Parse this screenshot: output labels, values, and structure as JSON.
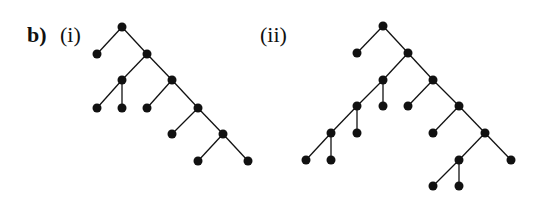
{
  "labels": {
    "panel": "b)",
    "tree1": "(i)",
    "tree2": "(ii)"
  },
  "trees": [
    {
      "name": "(i)",
      "nodes": [
        [
          122,
          27
        ],
        [
          97,
          54
        ],
        [
          147,
          54
        ],
        [
          122,
          80
        ],
        [
          172,
          80
        ],
        [
          97,
          108
        ],
        [
          122,
          108
        ],
        [
          147,
          108
        ],
        [
          198,
          108
        ],
        [
          172,
          134
        ],
        [
          223,
          134
        ],
        [
          198,
          161
        ],
        [
          248,
          161
        ]
      ],
      "edges": [
        [
          0,
          1
        ],
        [
          0,
          2
        ],
        [
          2,
          3
        ],
        [
          2,
          4
        ],
        [
          3,
          5
        ],
        [
          3,
          6
        ],
        [
          4,
          7
        ],
        [
          4,
          8
        ],
        [
          8,
          9
        ],
        [
          8,
          10
        ],
        [
          10,
          11
        ],
        [
          10,
          12
        ]
      ]
    },
    {
      "name": "(ii)",
      "nodes": [
        [
          383,
          26
        ],
        [
          357,
          53
        ],
        [
          408,
          53
        ],
        [
          383,
          80
        ],
        [
          433,
          80
        ],
        [
          357,
          106
        ],
        [
          383,
          106
        ],
        [
          331,
          133
        ],
        [
          357,
          133
        ],
        [
          306,
          160
        ],
        [
          331,
          160
        ],
        [
          408,
          106
        ],
        [
          459,
          106
        ],
        [
          433,
          133
        ],
        [
          485,
          133
        ],
        [
          459,
          160
        ],
        [
          511,
          160
        ],
        [
          433,
          186
        ],
        [
          459,
          186
        ]
      ],
      "edges": [
        [
          0,
          1
        ],
        [
          0,
          2
        ],
        [
          2,
          3
        ],
        [
          2,
          4
        ],
        [
          3,
          5
        ],
        [
          3,
          6
        ],
        [
          5,
          7
        ],
        [
          5,
          8
        ],
        [
          7,
          9
        ],
        [
          7,
          10
        ],
        [
          4,
          11
        ],
        [
          4,
          12
        ],
        [
          12,
          13
        ],
        [
          12,
          14
        ],
        [
          14,
          15
        ],
        [
          14,
          16
        ],
        [
          15,
          17
        ],
        [
          15,
          18
        ]
      ]
    }
  ],
  "style": {
    "ink": "#111111",
    "node_radius": 4.5
  }
}
